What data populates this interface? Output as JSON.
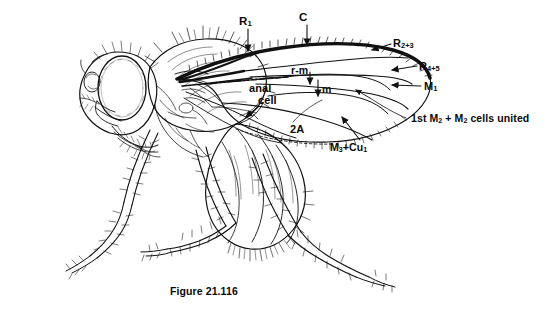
{
  "figure": {
    "caption": "Figure 21.116",
    "ink_color": "#111111",
    "background_color": "#ffffff"
  },
  "labels": {
    "r1": "R",
    "r1_sub": "1",
    "c": "C",
    "r23": "R",
    "r23_sub": "2+3",
    "r45": "R",
    "r45_sub": "4+5",
    "m1": "M",
    "m1_sub": "1",
    "rm": "r-m",
    "m": "m",
    "anal": "anal",
    "cell": "cell",
    "a2": "2A",
    "m3cu1_a": "M",
    "m3cu1_a_sub": "3",
    "m3cu1_plus": "+Cu",
    "m3cu1_b_sub": "1",
    "united_1": "1st M",
    "united_1_sub": "2",
    "united_2": " + M",
    "united_2_sub": "2",
    "united_3": " cells united"
  }
}
